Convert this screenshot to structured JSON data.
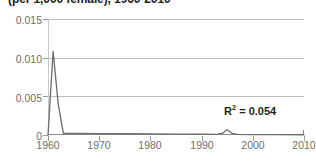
{
  "chart_data": {
    "type": "line",
    "title": "(per 1,000 female), 1960-2010",
    "xlabel": "",
    "ylabel": "",
    "xlim": [
      1960,
      2010
    ],
    "ylim": [
      0,
      0.015
    ],
    "xticks": [
      1960,
      1970,
      1980,
      1990,
      2000,
      2010
    ],
    "xticklabels": [
      "1960",
      "1970",
      "1980",
      "1990",
      "2000",
      "2010"
    ],
    "yticks": [
      0,
      0.005,
      0.01,
      0.015
    ],
    "yticklabels": [
      "0",
      "0.005",
      "0.010",
      "0.015"
    ],
    "grid": "horizontal",
    "legend": "none",
    "line_color": "#6b6b6b",
    "x": [
      1960,
      1961,
      1962,
      1963,
      1965,
      1970,
      1975,
      1980,
      1985,
      1990,
      1993,
      1994,
      1995,
      1996,
      1997,
      2000,
      2005,
      2010
    ],
    "values": [
      0.0,
      0.0108,
      0.004,
      0.0002,
      0.0002,
      0.00018,
      0.00016,
      0.00014,
      0.00012,
      0.0001,
      8e-05,
      0.0002,
      0.00068,
      0.0002,
      7e-05,
      5e-05,
      4e-05,
      3e-05
    ],
    "annotations": [
      {
        "text": "R",
        "sup": "2",
        "suffix": " = 0.054",
        "full": "R2 = 0.054",
        "value": 0.054
      }
    ]
  },
  "annotation": {
    "r2_prefix": "R",
    "r2_sup": "2",
    "r2_value": " = 0.054"
  },
  "axes": {
    "y_labels": [
      "0.015",
      "0.010",
      "0.005",
      "0"
    ],
    "x_labels": [
      "1960",
      "1970",
      "1980",
      "1990",
      "2000",
      "2010"
    ]
  },
  "colors": {
    "grid": "#bcbcbc",
    "axis": "#8a8a8a",
    "tick_text": "#6e6e6e",
    "series": "#6b6b6b",
    "annotation_text": "#231f20",
    "background": "#ffffff"
  }
}
